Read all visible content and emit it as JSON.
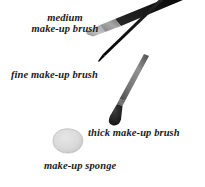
{
  "figure": {
    "background_color": "#ffffff",
    "width": 205,
    "height": 187,
    "items": [
      {
        "id": "medium-brush",
        "icon": "medium-make-up-brush-icon",
        "label_line1": "medium",
        "label_line2": "make-up brush",
        "full_label": "medium make-up brush",
        "handle_color": "#111111",
        "ferrule_color": "#8d8d8d",
        "bristle_color": "#b8b8b8"
      },
      {
        "id": "fine-brush",
        "icon": "fine-make-up-brush-icon",
        "label": "fine make-up brush",
        "handle_color": "#1c1c1c",
        "tip_color": "#000000"
      },
      {
        "id": "thick-brush",
        "icon": "thick-make-up-brush-icon",
        "label": "thick make-up brush",
        "handle_color": "#6f6f6f",
        "head_color": "#262626"
      },
      {
        "id": "sponge",
        "icon": "make-up-sponge-icon",
        "label": "make-up sponge",
        "fill_color": "#d8d8d8",
        "edge_color": "#bdbdbd"
      }
    ]
  },
  "labels": {
    "medium_line1": "medium",
    "medium_line2": "make-up brush",
    "fine": "fine make-up brush",
    "thick": "thick make-up brush",
    "sponge": "make-up sponge"
  },
  "colors": {
    "text": "#1a1a1a",
    "background": "#ffffff",
    "dark_handle": "#111111",
    "gray_handle": "#6f6f6f",
    "light_bristle": "#b8b8b8",
    "sponge_gray": "#d8d8d8"
  }
}
